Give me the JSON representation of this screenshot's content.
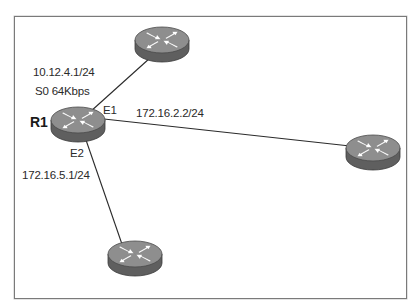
{
  "diagram": {
    "frame": {
      "x": 14,
      "y": 16,
      "width": 392,
      "height": 282,
      "border_color": "#7a7a7a"
    },
    "colors": {
      "router_top": "#8e8e8e",
      "router_side": "#5f5f5f",
      "router_arrow": "#ffffff",
      "link": "#2a2a2a",
      "text": "#2a2a2a"
    },
    "routers": [
      {
        "id": "R1",
        "name": "R1",
        "icon": "router-icon",
        "cx": 78,
        "cy": 125
      },
      {
        "id": "top",
        "name": "",
        "icon": "router-icon",
        "cx": 162,
        "cy": 44
      },
      {
        "id": "right",
        "name": "",
        "icon": "router-icon",
        "cx": 373,
        "cy": 152
      },
      {
        "id": "bottom",
        "name": "",
        "icon": "router-icon",
        "cx": 135,
        "cy": 259
      }
    ],
    "links": [
      {
        "from": "R1",
        "to": "top",
        "x1": 90,
        "y1": 112,
        "x2": 150,
        "y2": 58
      },
      {
        "from": "R1",
        "to": "right",
        "x1": 104,
        "y1": 119,
        "x2": 350,
        "y2": 146
      },
      {
        "from": "R1",
        "to": "bottom",
        "x1": 86,
        "y1": 140,
        "x2": 124,
        "y2": 250
      }
    ],
    "labels": {
      "r1_name": "R1",
      "serial_ip": "10.12.4.1/24",
      "serial_interface": "S0 64Kbps",
      "e1_interface": "E1",
      "e1_remote_ip": "172.16.2.2/24",
      "e2_interface": "E2",
      "e2_ip": "172.16.5.1/24"
    }
  }
}
